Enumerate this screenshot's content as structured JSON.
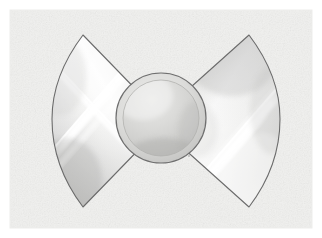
{
  "document": {
    "kind": "technical-illustration",
    "title": "Bowtie wing assembly with central dome",
    "description": "Grayscale rendering of a symmetric bowtie-shaped object: two mirrored curved wing panels with glossy diagonal highlight streaks flanking a round central dome.",
    "background_style": "light textured paper"
  },
  "canvas": {
    "width": 322,
    "height": 238,
    "margin": 10,
    "plate_left": 10,
    "plate_top": 10,
    "plate_width": 302,
    "plate_height": 218
  },
  "colors": {
    "page_background": "#ffffff",
    "plate_background": "#f3f3f1",
    "plate_texture_light": "#fbfbfa",
    "plate_texture_dark": "#e9e9e6",
    "outline": "#6b6b6b",
    "wing_fill_light": "#fdfdfd",
    "wing_fill_mid": "#e3e3e1",
    "wing_fill_dark": "#cfcfcd",
    "highlight_streak": "#ffffff",
    "dome_rim": "#6f6f6f",
    "dome_outer": "#d3d3d1",
    "dome_inner_light": "#e0e0de",
    "dome_inner_dark": "#c2c2c0",
    "dome_shadow": "#b8b8b6"
  },
  "shapes": {
    "left_wing": {
      "name": "left-wing-panel",
      "tip_top": [
        83,
        35
      ],
      "tip_bottom": [
        83,
        207
      ],
      "arc_extreme_x": 52,
      "inner_top": [
        150,
        104
      ],
      "inner_bottom": [
        150,
        138
      ],
      "fill": "#e6e6e4"
    },
    "right_wing": {
      "name": "right-wing-panel",
      "tip_top": [
        249,
        35
      ],
      "tip_bottom": [
        249,
        207
      ],
      "arc_extreme_x": 279,
      "inner_top": [
        172,
        104
      ],
      "inner_bottom": [
        172,
        138
      ],
      "fill": "#e6e6e4"
    },
    "center_dome": {
      "name": "center-dome",
      "center": [
        161,
        118
      ],
      "outer_radius": 45,
      "inner_radius": 38,
      "fill_outer": "#d3d3d1",
      "fill_inner": "#d8d8d6"
    },
    "highlights": [
      {
        "name": "left-streak-upper",
        "from": [
          60,
          150
        ],
        "to": [
          128,
          72
        ],
        "width": 7
      },
      {
        "name": "left-streak-lower",
        "from": [
          53,
          132
        ],
        "to": [
          118,
          58
        ],
        "width": 4
      },
      {
        "name": "left-streak-cross",
        "from": [
          62,
          68
        ],
        "to": [
          120,
          150
        ],
        "width": 5
      },
      {
        "name": "right-streak-upper",
        "from": [
          205,
          180
        ],
        "to": [
          272,
          104
        ],
        "width": 8
      },
      {
        "name": "right-streak-lower",
        "from": [
          198,
          196
        ],
        "to": [
          266,
          120
        ],
        "width": 4
      }
    ]
  },
  "labels": {
    "figure_caption": "",
    "alt_text": "Symmetric bowtie illustration with two curved wing panels and a central circular dome"
  }
}
